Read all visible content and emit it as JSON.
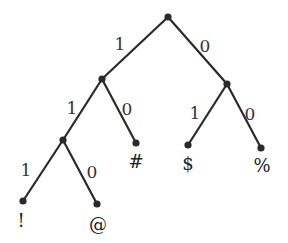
{
  "diagram": {
    "type": "binary-code-tree",
    "nodes": [
      {
        "id": "root",
        "x": 168,
        "y": 17
      },
      {
        "id": "n1",
        "x": 102,
        "y": 79
      },
      {
        "id": "n0",
        "x": 227,
        "y": 84
      },
      {
        "id": "n11",
        "x": 63,
        "y": 140
      },
      {
        "id": "leaf-hash",
        "x": 136,
        "y": 143,
        "label": "#"
      },
      {
        "id": "leaf-dollar",
        "x": 188,
        "y": 145,
        "label": "$"
      },
      {
        "id": "leaf-percent",
        "x": 261,
        "y": 148,
        "label": "%"
      },
      {
        "id": "leaf-excl",
        "x": 23,
        "y": 201,
        "label": "!"
      },
      {
        "id": "leaf-at",
        "x": 97,
        "y": 204,
        "label": "@"
      }
    ],
    "edges": [
      {
        "from": "root",
        "to": "n1",
        "label": "1",
        "lx": 120,
        "ly": 50
      },
      {
        "from": "root",
        "to": "n0",
        "label": "0",
        "lx": 205,
        "ly": 52
      },
      {
        "from": "n1",
        "to": "n11",
        "label": "1",
        "lx": 72,
        "ly": 114
      },
      {
        "from": "n1",
        "to": "leaf-hash",
        "label": "0",
        "lx": 127,
        "ly": 115
      },
      {
        "from": "n0",
        "to": "leaf-dollar",
        "label": "1",
        "lx": 195,
        "ly": 119
      },
      {
        "from": "n0",
        "to": "leaf-percent",
        "label": "0",
        "lx": 250,
        "ly": 120
      },
      {
        "from": "n11",
        "to": "leaf-excl",
        "label": "1",
        "lx": 26,
        "ly": 176
      },
      {
        "from": "n11",
        "to": "leaf-at",
        "label": "0",
        "lx": 92,
        "ly": 178
      }
    ],
    "leaf_labels": [
      {
        "text": "#",
        "x": 136,
        "y": 168
      },
      {
        "text": "$",
        "x": 188,
        "y": 170
      },
      {
        "text": "%",
        "x": 262,
        "y": 172
      },
      {
        "text": "!",
        "x": 21,
        "y": 227
      },
      {
        "text": "@",
        "x": 98,
        "y": 231
      }
    ]
  }
}
